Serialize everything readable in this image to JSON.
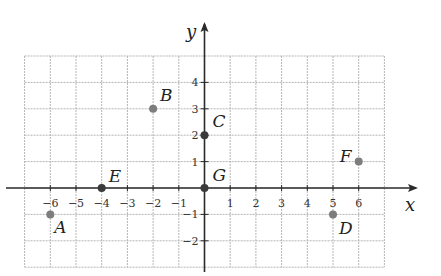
{
  "chart_data": {
    "type": "scatter",
    "title": "",
    "xlabel": "x",
    "ylabel": "y",
    "xlim": [
      -7,
      7
    ],
    "ylim": [
      -3,
      5
    ],
    "grid": true,
    "x_ticks": [
      -6,
      -5,
      -4,
      -3,
      -2,
      -1,
      1,
      2,
      3,
      4,
      5,
      6
    ],
    "x_tick_labels": [
      "−6",
      "−5",
      "−4",
      "−3",
      "−2",
      "−1",
      "1",
      "2",
      "3",
      "4",
      "5",
      "6"
    ],
    "y_ticks": [
      4,
      3,
      2,
      1,
      -1,
      -2
    ],
    "y_tick_labels": [
      "4",
      "3",
      "2",
      "1",
      "−1",
      "−2"
    ],
    "points": [
      {
        "label": "A",
        "x": -6,
        "y": -1
      },
      {
        "label": "B",
        "x": -2,
        "y": 3
      },
      {
        "label": "C",
        "x": 0,
        "y": 2
      },
      {
        "label": "D",
        "x": 5,
        "y": -1
      },
      {
        "label": "E",
        "x": -4,
        "y": 0
      },
      {
        "label": "F",
        "x": 6,
        "y": 1
      },
      {
        "label": "G",
        "x": 0,
        "y": 0
      }
    ]
  },
  "colors": {
    "grid": "#b5b5b5",
    "axis": "#2a2a2a",
    "point": "#7d7d7d",
    "point_on_axis": "#3a3a3a"
  }
}
